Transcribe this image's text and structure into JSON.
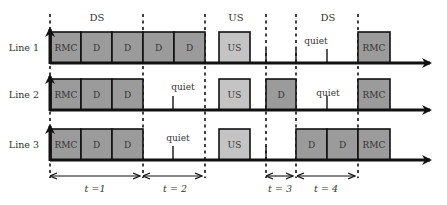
{
  "colors": {
    "dark_block": "#9b9b9b",
    "light_block": "#c4c4c4",
    "axis": "#111111",
    "text": "#333333"
  },
  "header_labels": [
    {
      "id": "ds1",
      "text": "DS",
      "x": 97
    },
    {
      "id": "us",
      "text": "US",
      "x": 236
    },
    {
      "id": "ds2",
      "text": "DS",
      "x": 328
    }
  ],
  "lines": [
    {
      "label": "Line 1",
      "baseline": 63,
      "blocks": [
        {
          "text": "RMC",
          "x": 51,
          "w": 30,
          "shade": "dark"
        },
        {
          "text": "D",
          "x": 81,
          "w": 31,
          "shade": "dark"
        },
        {
          "text": "D",
          "x": 112,
          "w": 31,
          "shade": "dark"
        },
        {
          "text": "D",
          "x": 143,
          "w": 31,
          "shade": "dark"
        },
        {
          "text": "D",
          "x": 174,
          "w": 31,
          "shade": "dark"
        },
        {
          "text": "US",
          "x": 219,
          "w": 31,
          "shade": "light"
        },
        {
          "text": "RMC",
          "x": 358,
          "w": 32,
          "shade": "dark"
        }
      ],
      "ticks": [
        266,
        296,
        327
      ],
      "quiet": [
        {
          "text": "quiet",
          "x": 316,
          "y": 44
        }
      ]
    },
    {
      "label": "Line 2",
      "baseline": 110,
      "blocks": [
        {
          "text": "RMC",
          "x": 51,
          "w": 30,
          "shade": "dark"
        },
        {
          "text": "D",
          "x": 81,
          "w": 31,
          "shade": "dark"
        },
        {
          "text": "D",
          "x": 112,
          "w": 31,
          "shade": "dark"
        },
        {
          "text": "US",
          "x": 219,
          "w": 31,
          "shade": "light"
        },
        {
          "text": "D",
          "x": 266,
          "w": 30,
          "shade": "dark"
        },
        {
          "text": "RMC",
          "x": 358,
          "w": 32,
          "shade": "dark"
        }
      ],
      "ticks": [
        173,
        327
      ],
      "quiet": [
        {
          "text": "quiet",
          "x": 183,
          "y": 90
        },
        {
          "text": "quiet",
          "x": 328,
          "y": 96
        }
      ]
    },
    {
      "label": "Line 3",
      "baseline": 160,
      "blocks": [
        {
          "text": "RMC",
          "x": 51,
          "w": 30,
          "shade": "dark"
        },
        {
          "text": "D",
          "x": 81,
          "w": 31,
          "shade": "dark"
        },
        {
          "text": "D",
          "x": 112,
          "w": 31,
          "shade": "dark"
        },
        {
          "text": "US",
          "x": 219,
          "w": 31,
          "shade": "light"
        },
        {
          "text": "D",
          "x": 296,
          "w": 31,
          "shade": "dark"
        },
        {
          "text": "D",
          "x": 327,
          "w": 31,
          "shade": "dark"
        },
        {
          "text": "RMC",
          "x": 358,
          "w": 32,
          "shade": "dark"
        }
      ],
      "ticks": [
        173,
        266
      ],
      "quiet": [
        {
          "text": "quiet",
          "x": 178,
          "y": 141
        }
      ]
    }
  ],
  "dividers": [
    50,
    143,
    205,
    266,
    296,
    358
  ],
  "intervals": [
    {
      "label": "t =1",
      "x1": 50,
      "x2": 141,
      "lx": 95
    },
    {
      "label": "t = 2",
      "x1": 143,
      "x2": 203,
      "lx": 175
    },
    {
      "label": "t = 3",
      "x1": 266,
      "x2": 294,
      "lx": 280
    },
    {
      "label": "t = 4",
      "x1": 297,
      "x2": 356,
      "lx": 326
    }
  ]
}
